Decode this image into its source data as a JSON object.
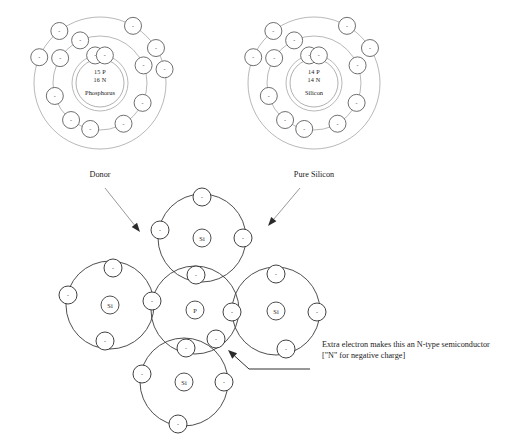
{
  "diagram": {
    "background_color": "#ffffff",
    "ink_color": "#1a1a1a",
    "shell_color": "#9a9a9a",
    "bond_color": "#3a3a3a"
  },
  "atoms": {
    "donor": {
      "caption": "Donor",
      "nucleus_protons": "15 P",
      "nucleus_neutrons": "16 N",
      "element_name": "Phosphorus",
      "element_symbol": "P",
      "shell_counts": [
        2,
        8,
        5
      ],
      "total_electrons": 15,
      "center": {
        "cx": 100,
        "cy": 83
      },
      "shell_radii": [
        28,
        47,
        66
      ],
      "nucleus_radius": 24,
      "electron_radius": 8.5,
      "electrons": [
        {
          "shell": 1,
          "angle": 100
        },
        {
          "shell": 1,
          "angle": 80
        },
        {
          "shell": 2,
          "angle": 115
        },
        {
          "shell": 2,
          "angle": 148
        },
        {
          "shell": 2,
          "angle": 196
        },
        {
          "shell": 2,
          "angle": 232
        },
        {
          "shell": 2,
          "angle": 258
        },
        {
          "shell": 2,
          "angle": 300
        },
        {
          "shell": 2,
          "angle": 335
        },
        {
          "shell": 2,
          "angle": 22
        },
        {
          "shell": 3,
          "angle": 128
        },
        {
          "shell": 3,
          "angle": 157
        },
        {
          "shell": 3,
          "angle": 60
        },
        {
          "shell": 3,
          "angle": 32
        },
        {
          "shell": 3,
          "angle": 12
        }
      ]
    },
    "pure_silicon": {
      "caption": "Pure Silicon",
      "nucleus_protons": "14 P",
      "nucleus_neutrons": "14 N",
      "element_name": "Silicon",
      "element_symbol": "Si",
      "shell_counts": [
        2,
        8,
        4
      ],
      "total_electrons": 14,
      "center": {
        "cx": 314,
        "cy": 83
      },
      "shell_radii": [
        28,
        47,
        66
      ],
      "nucleus_radius": 24,
      "electron_radius": 8.5,
      "electrons": [
        {
          "shell": 1,
          "angle": 100
        },
        {
          "shell": 1,
          "angle": 80
        },
        {
          "shell": 2,
          "angle": 115
        },
        {
          "shell": 2,
          "angle": 148
        },
        {
          "shell": 2,
          "angle": 196
        },
        {
          "shell": 2,
          "angle": 232
        },
        {
          "shell": 2,
          "angle": 258
        },
        {
          "shell": 2,
          "angle": 300
        },
        {
          "shell": 2,
          "angle": 335
        },
        {
          "shell": 2,
          "angle": 22
        },
        {
          "shell": 3,
          "angle": 128
        },
        {
          "shell": 3,
          "angle": 157
        },
        {
          "shell": 3,
          "angle": 60
        },
        {
          "shell": 3,
          "angle": 32
        }
      ]
    }
  },
  "pointer_arrows": [
    {
      "name": "donor-to-lattice",
      "from": {
        "x": 105,
        "y": 188
      },
      "to": {
        "x": 140,
        "y": 232
      }
    },
    {
      "name": "silicon-to-lattice",
      "from": {
        "x": 300,
        "y": 188
      },
      "to": {
        "x": 268,
        "y": 226
      }
    }
  ],
  "lattice": {
    "name": "doped-silicon-lattice",
    "bond_orbit_radius": 44,
    "core_radius": 9,
    "electron_radius": 9,
    "atoms": [
      {
        "id": "si-top",
        "symbol": "Si",
        "cx": 202,
        "cy": 238
      },
      {
        "id": "si-left",
        "symbol": "Si",
        "cx": 110,
        "cy": 305
      },
      {
        "id": "p-center",
        "symbol": "P",
        "cx": 195,
        "cy": 310
      },
      {
        "id": "si-right",
        "symbol": "Si",
        "cx": 276,
        "cy": 311
      },
      {
        "id": "si-bottom",
        "symbol": "Si",
        "cx": 184,
        "cy": 382
      }
    ],
    "electrons": [
      {
        "name": "si-top-north",
        "cx": 202,
        "cy": 197
      },
      {
        "name": "si-top-west",
        "cx": 160,
        "cy": 230
      },
      {
        "name": "si-top-east",
        "cx": 243,
        "cy": 238
      },
      {
        "name": "bond-top-p",
        "cx": 196,
        "cy": 275
      },
      {
        "name": "si-left-north",
        "cx": 113,
        "cy": 268
      },
      {
        "name": "si-left-west",
        "cx": 68,
        "cy": 295
      },
      {
        "name": "si-left-south",
        "cx": 105,
        "cy": 341
      },
      {
        "name": "bond-left-p",
        "cx": 152,
        "cy": 301
      },
      {
        "name": "bond-right-p",
        "cx": 232,
        "cy": 312
      },
      {
        "name": "si-right-north",
        "cx": 276,
        "cy": 274
      },
      {
        "name": "si-right-east",
        "cx": 317,
        "cy": 312
      },
      {
        "name": "si-right-south",
        "cx": 286,
        "cy": 349
      },
      {
        "name": "bond-bottom-p",
        "cx": 186,
        "cy": 348
      },
      {
        "name": "si-bottom-west",
        "cx": 142,
        "cy": 374
      },
      {
        "name": "si-bottom-east",
        "cx": 224,
        "cy": 382
      },
      {
        "name": "si-bottom-south",
        "cx": 178,
        "cy": 424
      },
      {
        "name": "extra-electron",
        "cx": 216,
        "cy": 339
      }
    ]
  },
  "annotation": {
    "name": "extra-electron-note",
    "line1": "Extra electron makes this an N-type semiconductor",
    "line2": "[\"N\" for negative charge]",
    "text_x": 322,
    "line1_y": 347,
    "line2_y": 358,
    "leader": {
      "elbow_x": 310,
      "elbow_y": 369,
      "mid_x": 249,
      "arrow_x": 228,
      "arrow_y": 350
    }
  }
}
